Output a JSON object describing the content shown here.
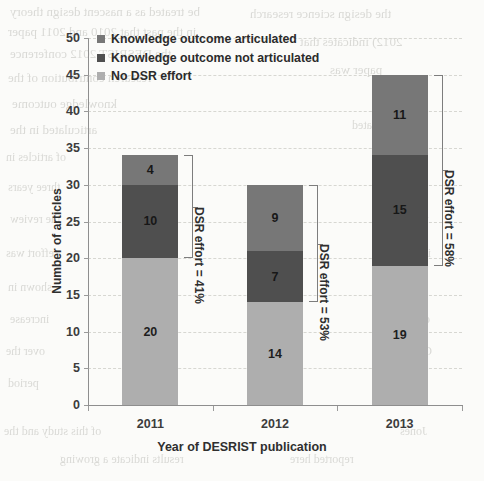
{
  "chart_data": {
    "type": "bar",
    "subtype": "stacked-column",
    "title": "",
    "xlabel": "Year of DESRIST publication",
    "ylabel": "Number of articles",
    "categories": [
      "2011",
      "2012",
      "2013"
    ],
    "ylim": [
      0,
      50
    ],
    "yticks": [
      0,
      5,
      10,
      15,
      20,
      25,
      30,
      35,
      40,
      45,
      50
    ],
    "grid": true,
    "legend_position": "top-left-inside",
    "stack_order_bottom_to_top": [
      "No DSR effort",
      "Knowledge outcome not articulated",
      "Knowledge outcome articulated"
    ],
    "series": [
      {
        "name": "No DSR effort",
        "color": "#aeaeae",
        "values": [
          20,
          14,
          19
        ]
      },
      {
        "name": "Knowledge outcome not articulated",
        "color": "#4f4f4f",
        "values": [
          10,
          7,
          15
        ]
      },
      {
        "name": "Knowledge outcome articulated",
        "color": "#777777",
        "values": [
          4,
          9,
          11
        ]
      }
    ],
    "totals": [
      34,
      30,
      45
    ],
    "annotations": [
      {
        "category": "2011",
        "text": "DSR effort = 41%",
        "from": 20,
        "to": 34
      },
      {
        "category": "2012",
        "text": "DSR effort = 53%",
        "from": 14,
        "to": 30
      },
      {
        "category": "2013",
        "text": "DSR effort = 58%",
        "from": 19,
        "to": 45
      }
    ]
  },
  "axes": {
    "y_title": "Number of articles",
    "x_title": "Year of DESRIST publication",
    "y_tick_labels": [
      "50",
      "45",
      "40",
      "35",
      "30",
      "25",
      "20",
      "15",
      "10",
      "5",
      "0"
    ],
    "x_tick_labels": [
      "2011",
      "2012",
      "2013"
    ]
  },
  "legend": {
    "items": [
      {
        "label": "Knowledge outcome articulated",
        "color": "#777777"
      },
      {
        "label": "Knowledge outcome not articulated",
        "color": "#4f4f4f"
      },
      {
        "label": "No DSR effort",
        "color": "#aeaeae"
      }
    ]
  },
  "bar_labels": {
    "y2011": [
      "4",
      "10",
      "20"
    ],
    "y2012": [
      "9",
      "7",
      "14"
    ],
    "y2013": [
      "11",
      "15",
      "19"
    ]
  },
  "annotation_labels": [
    "DSR effort = 41%",
    "DSR effort = 53%",
    "DSR effort = 58%"
  ],
  "page_background_text": [
    {
      "text": "be treated as a nascent design theory",
      "x": 10,
      "y": 4,
      "size": 13
    },
    {
      "text": "in the past that 2010 and 2011 paper",
      "x": 8,
      "y": 24,
      "size": 13
    },
    {
      "text": "the DESRIST 2012 conference",
      "x": 10,
      "y": 46,
      "size": 13
    },
    {
      "text": "research contribution of the",
      "x": 8,
      "y": 70,
      "size": 13
    },
    {
      "text": "knowledge outcome",
      "x": 12,
      "y": 96,
      "size": 13
    },
    {
      "text": "articulated in the",
      "x": 10,
      "y": 122,
      "size": 13
    },
    {
      "text": "of articles in",
      "x": 6,
      "y": 150,
      "size": 12
    },
    {
      "text": "three years",
      "x": 8,
      "y": 180,
      "size": 12
    },
    {
      "text": "the review",
      "x": 10,
      "y": 212,
      "size": 12
    },
    {
      "text": "effort was",
      "x": 6,
      "y": 246,
      "size": 12
    },
    {
      "text": "shown in",
      "x": 8,
      "y": 280,
      "size": 12
    },
    {
      "text": "increase",
      "x": 10,
      "y": 312,
      "size": 12
    },
    {
      "text": "over the",
      "x": 6,
      "y": 344,
      "size": 12
    },
    {
      "text": "period",
      "x": 8,
      "y": 376,
      "size": 12
    },
    {
      "text": "of this study and the",
      "x": 4,
      "y": 424,
      "size": 12
    },
    {
      "text": "results indicate a growing",
      "x": 60,
      "y": 452,
      "size": 12
    },
    {
      "text": "the design science research",
      "x": 250,
      "y": 6,
      "size": 13
    },
    {
      "text": "2012) indicates that",
      "x": 300,
      "y": 34,
      "size": 13
    },
    {
      "text": "paper was",
      "x": 330,
      "y": 62,
      "size": 13
    },
    {
      "text": "not",
      "x": 372,
      "y": 90,
      "size": 13
    },
    {
      "text": "articulated",
      "x": 352,
      "y": 118,
      "size": 12
    },
    {
      "text": "as a",
      "x": 400,
      "y": 148,
      "size": 12
    },
    {
      "text": "design",
      "x": 392,
      "y": 180,
      "size": 12
    },
    {
      "text": "theory",
      "x": 398,
      "y": 212,
      "size": 12
    },
    {
      "text": "in the",
      "x": 404,
      "y": 246,
      "size": 12
    },
    {
      "text": "sense",
      "x": 400,
      "y": 280,
      "size": 12
    },
    {
      "text": "of",
      "x": 420,
      "y": 312,
      "size": 12
    },
    {
      "text": "Gregor",
      "x": 398,
      "y": 344,
      "size": 12
    },
    {
      "text": "and",
      "x": 410,
      "y": 376,
      "size": 12
    },
    {
      "text": "Jones",
      "x": 400,
      "y": 424,
      "size": 12
    },
    {
      "text": "reported here",
      "x": 290,
      "y": 452,
      "size": 12
    }
  ]
}
